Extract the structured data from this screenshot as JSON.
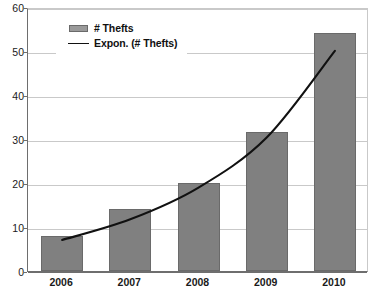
{
  "chart_data": {
    "type": "bar",
    "title": "",
    "xlabel": "",
    "ylabel": "",
    "categories": [
      "2006",
      "2007",
      "2008",
      "2009",
      "2010"
    ],
    "series": [
      {
        "name": "# Thefts",
        "type": "bar",
        "color": "#808080",
        "values": [
          8,
          14,
          20,
          31.5,
          54
        ]
      },
      {
        "name": "Expon. (# Thefts)",
        "type": "line",
        "color": "#111111",
        "values": [
          7.5,
          12.2,
          19.4,
          30.8,
          50.5
        ]
      }
    ],
    "ylim": [
      0,
      60
    ],
    "yticks": [
      0,
      10,
      20,
      30,
      40,
      50,
      60
    ],
    "ytick_labels": [
      "0",
      "10",
      "20",
      "30",
      "40",
      "50",
      "60"
    ],
    "grid": true,
    "legend_position": "top-left"
  },
  "legend": {
    "entries": [
      {
        "label": "# Thefts",
        "marker": "bar-swatch"
      },
      {
        "label": "Expon. (# Thefts)",
        "marker": "line-swatch"
      }
    ]
  },
  "colors": {
    "bar_fill": "#808080",
    "bar_border": "#6a6a6a",
    "trendline": "#111111",
    "gridline": "#c9c9c9",
    "axis": "#6e6e6e",
    "background": "#ffffff",
    "text": "#1a1a1a"
  }
}
